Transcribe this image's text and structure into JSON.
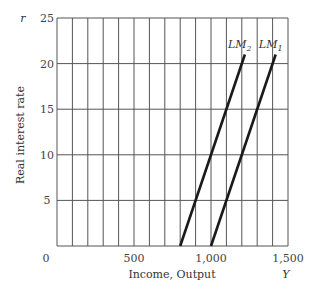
{
  "chart_data": {
    "type": "line",
    "title": "",
    "xlabel": "Income, Output",
    "ylabel": "Real interest rate",
    "x_axis_symbol": "Y",
    "y_axis_symbol": "r",
    "xlim": [
      0,
      1500
    ],
    "ylim": [
      0,
      25
    ],
    "x_ticks": [
      "0",
      "500",
      "1,000",
      "1,500"
    ],
    "y_ticks": [
      "5",
      "10",
      "15",
      "20",
      "25"
    ],
    "grid": true,
    "x_grid_step": 100,
    "y_grid_step": 5,
    "series": [
      {
        "name": "LM2",
        "label_main": "LM",
        "label_sub": "2",
        "x": [
          800,
          1220
        ],
        "y": [
          0,
          21
        ]
      },
      {
        "name": "LM1",
        "label_main": "LM",
        "label_sub": "1",
        "x": [
          1000,
          1420
        ],
        "y": [
          0,
          21
        ]
      }
    ]
  }
}
